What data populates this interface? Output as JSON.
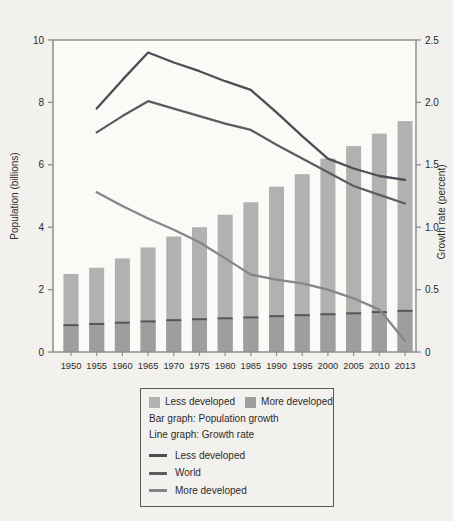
{
  "chart_data": {
    "type": "bar+line",
    "categories": [
      "1950",
      "1955",
      "1960",
      "1965",
      "1970",
      "1975",
      "1980",
      "1985",
      "1990",
      "1995",
      "2000",
      "2005",
      "2010",
      "2013"
    ],
    "bars": {
      "stacked": true,
      "unit": "billions",
      "totals": [
        2.5,
        2.7,
        3.0,
        3.35,
        3.7,
        4.0,
        4.4,
        4.8,
        5.3,
        5.7,
        6.2,
        6.6,
        7.0,
        7.4
      ],
      "series": [
        {
          "name": "More developed",
          "values": [
            0.86,
            0.9,
            0.94,
            0.98,
            1.02,
            1.05,
            1.08,
            1.11,
            1.15,
            1.18,
            1.21,
            1.24,
            1.28,
            1.32
          ],
          "color": "#9e9e9e"
        },
        {
          "name": "Less developed",
          "values": [
            1.64,
            1.8,
            2.06,
            2.37,
            2.68,
            2.95,
            3.32,
            3.69,
            4.15,
            4.52,
            4.99,
            5.36,
            5.72,
            6.08
          ],
          "color": "#b1b1b1"
        }
      ],
      "divider_color": "#54565c"
    },
    "lines": {
      "unit": "percent",
      "start_category": "1955",
      "start_index": 1,
      "series": [
        {
          "name": "Less developed",
          "values": [
            1.95,
            2.18,
            2.4,
            2.32,
            2.25,
            2.17,
            2.1,
            1.92,
            1.73,
            1.55,
            1.47,
            1.41,
            1.38
          ],
          "color": "#4b4e54"
        },
        {
          "name": "World",
          "values": [
            1.76,
            1.89,
            2.01,
            1.95,
            1.89,
            1.83,
            1.78,
            1.66,
            1.55,
            1.44,
            1.33,
            1.26,
            1.19
          ],
          "color": "#5a5d62"
        },
        {
          "name": "More developed",
          "values": [
            1.28,
            1.17,
            1.07,
            0.98,
            0.88,
            0.75,
            0.62,
            0.58,
            0.55,
            0.5,
            0.43,
            0.34,
            0.09
          ],
          "color": "#83868a"
        }
      ]
    },
    "axes": {
      "left": {
        "label": "Population (billions)",
        "min": 0,
        "max": 10,
        "ticks": [
          {
            "value": 0,
            "label": "0"
          },
          {
            "value": 2,
            "label": "2"
          },
          {
            "value": 4,
            "label": "4"
          },
          {
            "value": 6,
            "label": "6"
          },
          {
            "value": 8,
            "label": "8"
          },
          {
            "value": 10,
            "label": "10"
          }
        ]
      },
      "right": {
        "label": "Growth rate (percent)",
        "min": 0,
        "max": 2.5,
        "ticks": [
          {
            "value": 0,
            "label": "0"
          },
          {
            "value": 0.5,
            "label": "0.5"
          },
          {
            "value": 1.0,
            "label": "1.0"
          },
          {
            "value": 1.5,
            "label": "1.5"
          },
          {
            "value": 2.0,
            "label": "2.0"
          },
          {
            "value": 2.5,
            "label": "2.5"
          }
        ]
      }
    },
    "grid": false,
    "colors": {
      "plot_bg": "#fbfaf7",
      "frame": "#8f8f8f",
      "text": "#2b2b2b",
      "page_bg": "#f3f1ed"
    }
  },
  "legend": {
    "bar_entries": [
      {
        "label": "Less developed",
        "color": "#b1b1b1"
      },
      {
        "label": "More developed",
        "color": "#9e9e9e"
      }
    ],
    "bar_caption": "Bar graph: Population growth",
    "line_caption": "Line graph: Growth rate",
    "line_entries": [
      {
        "label": "Less developed",
        "color": "#4b4e54"
      },
      {
        "label": "World",
        "color": "#5a5d62"
      },
      {
        "label": "More developed",
        "color": "#83868a"
      }
    ]
  }
}
